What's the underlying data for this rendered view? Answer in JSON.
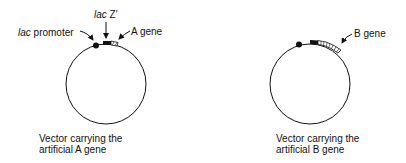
{
  "diagram_a": {
    "labels": {
      "lac_z_italic": "lac",
      "lac_z_rest": " Z′",
      "promoter_italic": "lac",
      "promoter_rest": " promoter",
      "gene": "A gene"
    },
    "caption_line1": "Vector carrying the",
    "caption_line2": "artificial A gene"
  },
  "diagram_b": {
    "labels": {
      "gene": "B gene"
    },
    "caption_line1": "Vector carrying the",
    "caption_line2": "artificial B gene"
  },
  "colors": {
    "stroke": "#111111",
    "background": "#ffffff"
  }
}
